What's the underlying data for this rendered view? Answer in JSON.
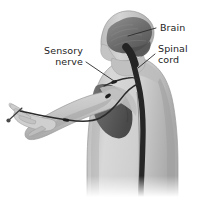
{
  "figure": {
    "background_color": "#ffffff",
    "width": 198,
    "height": 197
  },
  "labels": {
    "brain": {
      "text": "Brain",
      "lines": [
        "Brain"
      ],
      "anchor": "start",
      "x": 160,
      "y": 31
    },
    "spinal_cord": {
      "text": "Spinal cord",
      "line1": "Spinal",
      "line2": "cord",
      "anchor": "start",
      "x": 158,
      "y": 56
    },
    "sensory_nerve": {
      "text": "Sensory nerve",
      "line1": "Sensory",
      "line2": "nerve",
      "anchor": "end",
      "x": 83,
      "y": 59
    }
  },
  "anatomy": {
    "body_fill": "#c9c9c9",
    "body_shade": "#b0b0b0",
    "body_highlight": "#dedede",
    "brain_fill": "#6e6e6e",
    "brain_dark": "#4a4a4a",
    "nerve_color": "#2b2b2b",
    "spinal_cord_color": "#262626",
    "outline_color": "#8a8a8a",
    "parts": [
      {
        "name": "head",
        "description": "Head in profile, facing left"
      },
      {
        "name": "brain",
        "description": "Dark gray cerebrum inside skull"
      },
      {
        "name": "brainstem",
        "description": "Brainstem descending from brain"
      },
      {
        "name": "spinal-cord",
        "description": "Thick dark cord down the back"
      },
      {
        "name": "torso",
        "description": "Upper back and shoulders, rear three-quarter view"
      },
      {
        "name": "arm",
        "description": "Left arm extended forward to the left"
      },
      {
        "name": "hand",
        "description": "Open hand with fingers spread"
      },
      {
        "name": "sensory-nerve",
        "description": "Nerve running from fingertip up the arm to the spinal cord"
      },
      {
        "name": "ganglion",
        "description": "Small dark nerve nodes along the sensory nerve"
      },
      {
        "name": "pin",
        "description": "Pin pricking the fingertip"
      }
    ]
  }
}
